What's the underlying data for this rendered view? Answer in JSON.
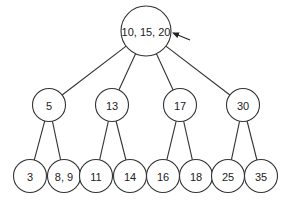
{
  "diagram": {
    "type": "tree",
    "stroke_color": "#333333",
    "background": "#ffffff",
    "root": {
      "id": "root",
      "label": "10, 15, 20",
      "cx": 146,
      "cy": 31,
      "r": 25
    },
    "level1": [
      {
        "id": "n5",
        "label": "5",
        "cx": 49,
        "cy": 105,
        "r": 16.5,
        "parent": "root"
      },
      {
        "id": "n13",
        "label": "13",
        "cx": 112,
        "cy": 105,
        "r": 16.5,
        "parent": "root"
      },
      {
        "id": "n17",
        "label": "17",
        "cx": 180,
        "cy": 105,
        "r": 16.5,
        "parent": "root"
      },
      {
        "id": "n30",
        "label": "30",
        "cx": 243,
        "cy": 105,
        "r": 16.5,
        "parent": "root"
      }
    ],
    "level2": [
      {
        "id": "n3",
        "label": "3",
        "cx": 30,
        "cy": 176,
        "r": 16.5,
        "parent": "n5"
      },
      {
        "id": "n89",
        "label": "8, 9",
        "cx": 64,
        "cy": 176,
        "r": 16.5,
        "parent": "n5"
      },
      {
        "id": "n11",
        "label": "11",
        "cx": 96,
        "cy": 176,
        "r": 16.5,
        "parent": "n13"
      },
      {
        "id": "n14",
        "label": "14",
        "cx": 130,
        "cy": 176,
        "r": 16.5,
        "parent": "n13"
      },
      {
        "id": "n16",
        "label": "16",
        "cx": 163,
        "cy": 176,
        "r": 16.5,
        "parent": "n17"
      },
      {
        "id": "n18",
        "label": "18",
        "cx": 196,
        "cy": 176,
        "r": 16.5,
        "parent": "n17"
      },
      {
        "id": "n25",
        "label": "25",
        "cx": 228,
        "cy": 176,
        "r": 16.5,
        "parent": "n30"
      },
      {
        "id": "n35",
        "label": "35",
        "cx": 261,
        "cy": 176,
        "r": 16.5,
        "parent": "n30"
      }
    ],
    "pointer_arrow": {
      "target": "root",
      "x1": 190,
      "y1": 40,
      "x2": 173,
      "y2": 33
    }
  }
}
